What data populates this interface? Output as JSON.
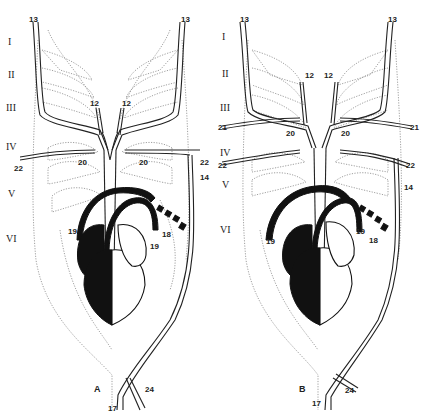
{
  "figure": {
    "panels": [
      {
        "id": "A",
        "letter": "A",
        "arch_labels": [
          "I",
          "II",
          "III",
          "IV",
          "V",
          "VI"
        ],
        "vessel_labels": {
          "top_left": "13",
          "top_right": "13",
          "inner_left": "12",
          "inner_right": "12",
          "mid_left": "20",
          "mid_right": "20",
          "side_left": "22",
          "side_right": "22",
          "lateral": "14",
          "arch_left": "19",
          "arch_right": "19",
          "ductus": "18",
          "bottom": "17",
          "bottom_branch": "24"
        }
      },
      {
        "id": "B",
        "letter": "B",
        "arch_labels": [
          "I",
          "II",
          "III",
          "IV",
          "V",
          "VI"
        ],
        "vessel_labels": {
          "top_left": "13",
          "top_right": "13",
          "inner_left": "12",
          "inner_right": "12",
          "side21_left": "21",
          "side21_right": "21",
          "mid_left": "20",
          "mid_right": "20",
          "side_left": "22",
          "side_right": "22",
          "lateral": "14",
          "arch_left": "19",
          "arch_right": "19",
          "ductus": "18",
          "bottom": "17",
          "bottom_branch": "24"
        }
      }
    ]
  }
}
